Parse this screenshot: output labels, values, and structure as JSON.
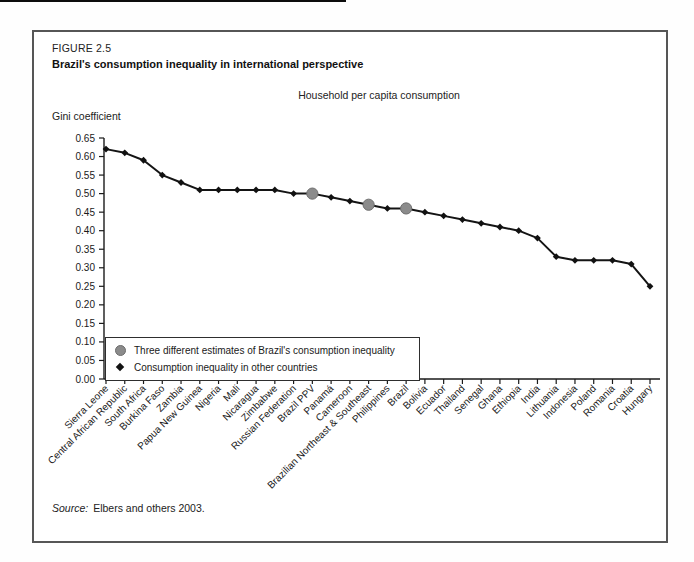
{
  "figure": {
    "label": "FIGURE 2.5",
    "title": "Brazil's consumption inequality in international perspective",
    "subtitle": "Household per capita consumption",
    "y_axis_label": "Gini coefficient",
    "source_prefix": "Source:",
    "source_text": "Elbers and others 2003."
  },
  "legend": [
    {
      "marker": "gray-circle",
      "label": "Three different estimates of Brazil's consumption inequality"
    },
    {
      "marker": "black-diamond",
      "label": "Consumption inequality in other countries"
    }
  ],
  "colors": {
    "line": "#141414",
    "diamond_marker": "#111111",
    "brazil_circle_fill": "#8b8b8b",
    "brazil_circle_edge": "#6e6e6e",
    "axis": "#1a1a1a",
    "text": "#1a1a1a",
    "box_border": "#565656"
  },
  "chart_data": {
    "type": "line",
    "title": "Household per capita consumption",
    "xlabel": "",
    "ylabel": "Gini coefficient",
    "ylim": [
      0,
      0.65
    ],
    "ytick_step": 0.05,
    "ytick_labels": [
      "0.00",
      "0.05",
      "0.10",
      "0.15",
      "0.20",
      "0.25",
      "0.30",
      "0.35",
      "0.40",
      "0.45",
      "0.50",
      "0.55",
      "0.60",
      "0.65"
    ],
    "grid": false,
    "legend_position": "inside-lower-left",
    "categories": [
      "Sierra Leone",
      "Central African Republic",
      "South Africa",
      "Burkina Faso",
      "Zambia",
      "Papua New Guinea",
      "Nigeria",
      "Mali",
      "Nicaragua",
      "Zimbabwe",
      "Russian Federation",
      "Brazil PPV",
      "Panamá",
      "Cameroon",
      "Brazilian Northeast & Southeast",
      "Philippines",
      "Brazil",
      "Bolivia",
      "Ecuador",
      "Thailand",
      "Senegal",
      "Ghana",
      "Ethiopia",
      "India",
      "Lithuania",
      "Indonesia",
      "Poland",
      "Romania",
      "Croatia",
      "Hungary"
    ],
    "values": [
      0.62,
      0.61,
      0.59,
      0.55,
      0.53,
      0.51,
      0.51,
      0.51,
      0.51,
      0.51,
      0.5,
      0.5,
      0.49,
      0.48,
      0.47,
      0.46,
      0.46,
      0.45,
      0.44,
      0.43,
      0.42,
      0.41,
      0.4,
      0.38,
      0.33,
      0.32,
      0.32,
      0.32,
      0.31,
      0.25
    ],
    "brazil_highlight_indices": [
      11,
      14,
      16
    ]
  }
}
